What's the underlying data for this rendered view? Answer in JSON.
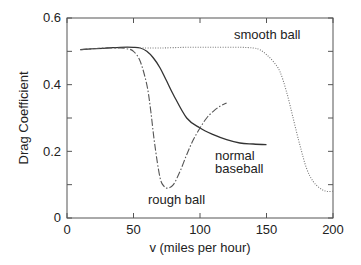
{
  "chart_data": {
    "type": "line",
    "title": "",
    "xlabel": "v (miles per hour)",
    "ylabel": "Drag Coefficient",
    "xlim": [
      0,
      200
    ],
    "ylim": [
      0,
      0.6
    ],
    "xticks": [
      0,
      50,
      100,
      150,
      200
    ],
    "xtick_labels": [
      "0",
      "50",
      "100",
      "150",
      "200"
    ],
    "yticks": [
      0,
      0.1,
      0.2,
      0.3,
      0.4,
      0.5,
      0.6
    ],
    "ytick_labels": [
      "0",
      "",
      "0.2",
      "",
      "0.4",
      "",
      "0.6"
    ],
    "grid": false,
    "legend": "none (curves labeled inline)",
    "series": [
      {
        "name": "normal baseball",
        "style": "solid",
        "x": [
          10,
          20,
          30,
          40,
          50,
          55,
          60,
          65,
          70,
          75,
          80,
          90,
          100,
          110,
          120,
          130,
          140,
          150
        ],
        "y": [
          0.505,
          0.508,
          0.51,
          0.512,
          0.512,
          0.51,
          0.5,
          0.48,
          0.45,
          0.41,
          0.37,
          0.3,
          0.27,
          0.25,
          0.235,
          0.225,
          0.222,
          0.22
        ]
      },
      {
        "name": "rough ball",
        "style": "dash-dot",
        "x": [
          10,
          20,
          30,
          40,
          45,
          50,
          55,
          60,
          63,
          66,
          70,
          73,
          76,
          80,
          85,
          90,
          95,
          100,
          105,
          110,
          115,
          120
        ],
        "y": [
          0.505,
          0.508,
          0.51,
          0.51,
          0.508,
          0.5,
          0.47,
          0.4,
          0.32,
          0.22,
          0.12,
          0.095,
          0.09,
          0.1,
          0.14,
          0.19,
          0.235,
          0.27,
          0.3,
          0.32,
          0.335,
          0.345
        ]
      },
      {
        "name": "smooth ball",
        "style": "dotted",
        "x": [
          55,
          70,
          90,
          110,
          130,
          140,
          145,
          150,
          155,
          160,
          165,
          170,
          175,
          180,
          185,
          190,
          195,
          200
        ],
        "y": [
          0.51,
          0.51,
          0.512,
          0.512,
          0.512,
          0.51,
          0.505,
          0.49,
          0.47,
          0.44,
          0.38,
          0.3,
          0.22,
          0.15,
          0.11,
          0.09,
          0.08,
          0.08
        ]
      }
    ],
    "annotations": [
      {
        "text": "smooth ball",
        "x": 167,
        "y": 0.545
      },
      {
        "text": "normal baseball",
        "x": 122,
        "y": 0.185
      },
      {
        "text": "rough ball",
        "x": 65,
        "y": 0.03
      }
    ]
  },
  "labels": {
    "xlabel": "v (miles per hour)",
    "ylabel": "Drag Coefficient",
    "annot_smooth": "smooth ball",
    "annot_normal_1": "normal",
    "annot_normal_2": "baseball",
    "annot_rough": "rough ball",
    "xt0": "0",
    "xt1": "50",
    "xt2": "100",
    "xt3": "150",
    "xt4": "200",
    "yt0": "0",
    "yt2": "0.2",
    "yt4": "0.4",
    "yt6": "0.6"
  },
  "colors": {
    "axis": "#555555",
    "normal": "#333333",
    "rough": "#555555",
    "smooth": "#777777"
  }
}
